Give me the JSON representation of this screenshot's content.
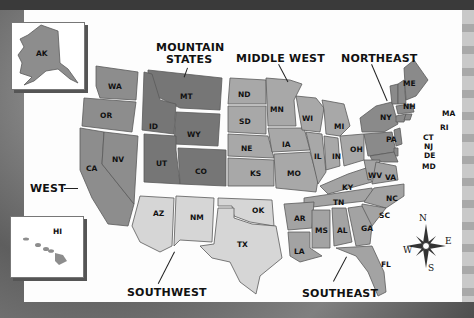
{
  "map": {
    "title": "United States Regions",
    "colors": {
      "west": "#8d8d8d",
      "mountain_states": "#767676",
      "middle_west": "#a8a8a8",
      "northeast": "#8a8a8a",
      "southwest": "#d6d6d6",
      "southeast": "#a3a3a3",
      "state_border": "#5a5a5a",
      "paper": "#fdfdfd"
    },
    "regions": [
      {
        "name": "WEST",
        "states": [
          "WA",
          "OR",
          "CA",
          "NV"
        ]
      },
      {
        "name": "MOUNTAIN STATES",
        "states": [
          "MT",
          "ID",
          "WY",
          "UT",
          "CO"
        ]
      },
      {
        "name": "MIDDLE WEST",
        "states": [
          "ND",
          "SD",
          "NE",
          "KS",
          "MN",
          "IA",
          "MO",
          "WI",
          "IL",
          "MI",
          "IN",
          "OH"
        ]
      },
      {
        "name": "NORTHEAST",
        "states": [
          "ME",
          "VT",
          "NH",
          "MA",
          "RI",
          "CT",
          "NY",
          "NJ",
          "PA",
          "DE",
          "MD"
        ]
      },
      {
        "name": "SOUTHWEST",
        "states": [
          "AZ",
          "NM",
          "OK",
          "TX"
        ]
      },
      {
        "name": "SOUTHEAST",
        "states": [
          "WV",
          "VA",
          "KY",
          "TN",
          "NC",
          "SC",
          "AR",
          "LA",
          "MS",
          "AL",
          "GA",
          "FL"
        ]
      }
    ],
    "region_labels": {
      "west": "WEST",
      "mountain_line1": "MOUNTAIN",
      "mountain_line2": "STATES",
      "middle_west": "MIDDLE WEST",
      "northeast": "NORTHEAST",
      "southwest": "SOUTHWEST",
      "southeast": "SOUTHEAST"
    },
    "insets": {
      "alaska": "AK",
      "hawaii": "HI"
    },
    "state_labels": {
      "WA": "WA",
      "OR": "OR",
      "CA": "CA",
      "NV": "NV",
      "MT": "MT",
      "ID": "ID",
      "WY": "WY",
      "UT": "UT",
      "CO": "CO",
      "ND": "ND",
      "SD": "SD",
      "NE": "NE",
      "KS": "KS",
      "MN": "MN",
      "IA": "IA",
      "MO": "MO",
      "WI": "WI",
      "IL": "IL",
      "MI": "MI",
      "IN": "IN",
      "OH": "OH",
      "ME": "ME",
      "VT": "VT",
      "NH": "NH",
      "MA": "MA",
      "RI": "RI",
      "CT": "CT",
      "NY": "NY",
      "NJ": "NJ",
      "PA": "PA",
      "DE": "DE",
      "MD": "MD",
      "AZ": "AZ",
      "NM": "NM",
      "OK": "OK",
      "TX": "TX",
      "WV": "WV",
      "VA": "VA",
      "KY": "KY",
      "TN": "TN",
      "NC": "NC",
      "SC": "SC",
      "AR": "AR",
      "LA": "LA",
      "MS": "MS",
      "AL": "AL",
      "GA": "GA",
      "FL": "FL"
    },
    "compass": {
      "N": "N",
      "S": "S",
      "E": "E",
      "W": "W"
    }
  }
}
